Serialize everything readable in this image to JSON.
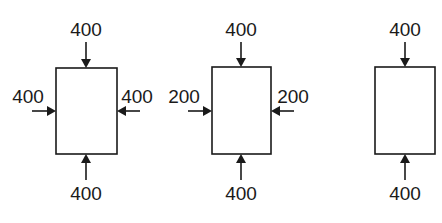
{
  "diagram": {
    "colors": {
      "stroke": "#1a1a1a",
      "background": "#ffffff"
    },
    "elements": [
      {
        "id": "element-1",
        "box": {
          "x": 56,
          "y": 68,
          "w": 61,
          "h": 86
        },
        "loads": {
          "top": "400",
          "bottom": "400",
          "left": "400",
          "right": "400"
        }
      },
      {
        "id": "element-2",
        "box": {
          "x": 212,
          "y": 67,
          "w": 59,
          "h": 87
        },
        "loads": {
          "top": "400",
          "bottom": "400",
          "left": "200",
          "right": "200"
        }
      },
      {
        "id": "element-3",
        "box": {
          "x": 375,
          "y": 67,
          "w": 60,
          "h": 87
        },
        "loads": {
          "top": "400",
          "bottom": "400"
        }
      }
    ]
  }
}
